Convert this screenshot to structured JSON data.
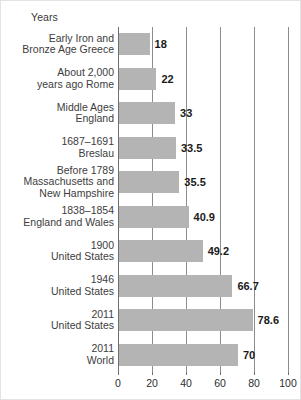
{
  "chart_data": {
    "type": "bar",
    "orientation": "horizontal",
    "title": "",
    "xlabel": "Years",
    "ylabel": "",
    "xlim": [
      0,
      100
    ],
    "xticks": [
      0,
      20,
      40,
      60,
      80,
      100
    ],
    "grid": true,
    "legend": null,
    "bar_color": "#b4b4b4",
    "categories": [
      "Early Iron and\nBronze Age Greece",
      "About 2,000\nyears ago Rome",
      "Middle Ages\nEngland",
      "1687–1691\nBreslau",
      "Before 1789\nMassachusetts and\nNew Hampshire",
      "1838–1854\nEngland and Wales",
      "1900\nUnited States",
      "1946\nUnited States",
      "2011\nUnited States",
      "2011\nWorld"
    ],
    "values": [
      18,
      22,
      33,
      33.5,
      35.5,
      40.9,
      49.2,
      66.7,
      78.6,
      70
    ],
    "value_labels": [
      "18",
      "22",
      "33",
      "33.5",
      "35.5",
      "40.9",
      "49.2",
      "66.7",
      "78.6",
      "70"
    ]
  },
  "axis_title": "Years",
  "rows": [
    {
      "lines": [
        "Early Iron and",
        "Bronze Age Greece"
      ],
      "value": 18,
      "label": "18"
    },
    {
      "lines": [
        "About 2,000",
        "years ago Rome"
      ],
      "value": 22,
      "label": "22"
    },
    {
      "lines": [
        "Middle Ages",
        "England"
      ],
      "value": 33,
      "label": "33"
    },
    {
      "lines": [
        "1687–1691",
        "Breslau"
      ],
      "value": 33.5,
      "label": "33.5"
    },
    {
      "lines": [
        "Before 1789",
        "Massachusetts and",
        "New Hampshire"
      ],
      "value": 35.5,
      "label": "35.5"
    },
    {
      "lines": [
        "1838–1854",
        "England and Wales"
      ],
      "value": 40.9,
      "label": "40.9"
    },
    {
      "lines": [
        "1900",
        "United States"
      ],
      "value": 49.2,
      "label": "49.2"
    },
    {
      "lines": [
        "1946",
        "United States"
      ],
      "value": 66.7,
      "label": "66.7"
    },
    {
      "lines": [
        "2011",
        "United States"
      ],
      "value": 78.6,
      "label": "78.6"
    },
    {
      "lines": [
        "2011",
        "World"
      ],
      "value": 70,
      "label": "70"
    }
  ],
  "xticks": [
    {
      "value": 0,
      "label": "0"
    },
    {
      "value": 20,
      "label": "20"
    },
    {
      "value": 40,
      "label": "40"
    },
    {
      "value": 60,
      "label": "60"
    },
    {
      "value": 80,
      "label": "80"
    },
    {
      "value": 100,
      "label": "100"
    }
  ]
}
